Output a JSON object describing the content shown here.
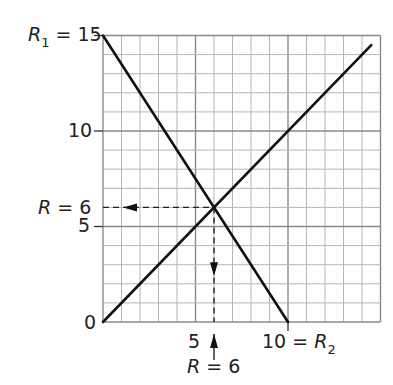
{
  "chart_data": {
    "type": "line",
    "title": "",
    "xlabel": "",
    "ylabel": "",
    "xlim": [
      0,
      15
    ],
    "ylim": [
      0,
      15
    ],
    "grid": true,
    "grid_minor_step": 1,
    "grid_major_step": 5,
    "series": [
      {
        "name": "R1 (falling)",
        "x": [
          0,
          10
        ],
        "y": [
          15,
          0
        ]
      },
      {
        "name": "R2 (rising)",
        "x": [
          0,
          14.5
        ],
        "y": [
          0,
          14.5
        ]
      }
    ],
    "intersection": {
      "x": 6,
      "y": 6
    },
    "y_ticks": [
      "0",
      "5",
      "10",
      "15"
    ],
    "x_ticks": [
      "5",
      "10"
    ],
    "annotations": [
      {
        "text": "R₁ = 15",
        "at": "y-axis top"
      },
      {
        "text": "R = 6",
        "at": "y = 6, arrow pointing left to axis"
      },
      {
        "text": "R = 6",
        "at": "below x = 6, arrow pointing up"
      },
      {
        "text": "10 = R₂",
        "at": "x-axis at 10"
      }
    ]
  },
  "labels": {
    "r1_prefix": "R",
    "r1_sub": "1",
    "r1_value": " = 15",
    "y10": "10",
    "y5": "5",
    "y0": "0",
    "ry_label": "R",
    "ry_value": " = 6",
    "x5": "5",
    "x10": "10 = ",
    "r2_prefix": "R",
    "r2_sub": "2",
    "rx_label": "R",
    "rx_value": " = 6"
  }
}
